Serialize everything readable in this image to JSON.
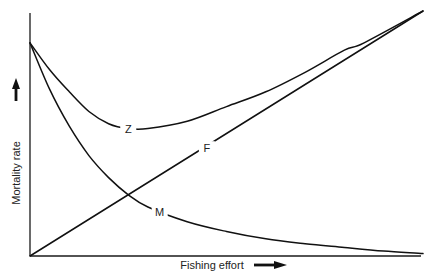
{
  "chart_data": {
    "type": "line",
    "title": "",
    "xlabel": "Fishing effort",
    "ylabel": "Mortality rate",
    "x_arrow": "right",
    "y_arrow": "up",
    "grid": false,
    "legend": "none (inline curve labels)",
    "ticks": {
      "x": [],
      "y": []
    },
    "xlim": [
      0,
      1
    ],
    "ylim": [
      0,
      1
    ],
    "series": [
      {
        "name": "Z",
        "label": "Z",
        "description": "Total mortality (F + M)",
        "x": [
          0.0,
          0.05,
          0.1,
          0.15,
          0.2,
          0.25,
          0.3,
          0.4,
          0.5,
          0.6,
          0.7,
          0.8,
          0.85,
          1.0
        ],
        "y": [
          0.87,
          0.76,
          0.67,
          0.59,
          0.54,
          0.52,
          0.52,
          0.55,
          0.61,
          0.67,
          0.75,
          0.84,
          0.87,
          1.0
        ]
      },
      {
        "name": "F",
        "label": "F",
        "description": "Fishing mortality, proportional to effort",
        "x": [
          0.0,
          1.0
        ],
        "y": [
          0.0,
          1.0
        ]
      },
      {
        "name": "M",
        "label": "M",
        "description": "Natural mortality, declining with effort",
        "x": [
          0.0,
          0.05,
          0.1,
          0.15,
          0.2,
          0.25,
          0.3,
          0.4,
          0.5,
          0.6,
          0.7,
          0.8,
          0.9,
          1.0
        ],
        "y": [
          0.87,
          0.68,
          0.53,
          0.41,
          0.32,
          0.25,
          0.2,
          0.14,
          0.1,
          0.07,
          0.05,
          0.035,
          0.02,
          0.01
        ]
      }
    ],
    "annotations": [
      {
        "text": "Z",
        "x": 0.25,
        "y": 0.52
      },
      {
        "text": "F",
        "x": 0.45,
        "y": 0.44
      },
      {
        "text": "M",
        "x": 0.33,
        "y": 0.18
      }
    ]
  },
  "labels": {
    "x_axis": "Fishing effort",
    "y_axis": "Mortality rate",
    "z": "Z",
    "f": "F",
    "m": "M"
  }
}
